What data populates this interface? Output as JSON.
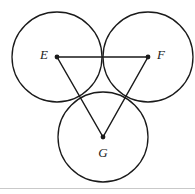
{
  "figure": {
    "background_color": "#ffffff",
    "stroke_color": "#1a1a1a",
    "rule_color": "#c9c9c9",
    "canvas": {
      "width": 195,
      "height": 194
    },
    "circles": [
      {
        "id": "circle-e",
        "cx": 57,
        "cy": 57,
        "r": 45
      },
      {
        "id": "circle-f",
        "cx": 148,
        "cy": 57,
        "r": 45
      },
      {
        "id": "circle-g",
        "cx": 103,
        "cy": 137,
        "r": 45
      }
    ],
    "triangle": {
      "id": "triangle-efg",
      "points": "57,57 148,57 103,137",
      "edges": [
        {
          "id": "edge-ef",
          "x1": 57,
          "y1": 57,
          "x2": 148,
          "y2": 57
        },
        {
          "id": "edge-fg",
          "x1": 148,
          "y1": 57,
          "x2": 103,
          "y2": 137
        },
        {
          "id": "edge-ge",
          "x1": 103,
          "y1": 137,
          "x2": 57,
          "y2": 57
        }
      ]
    },
    "vertices": [
      {
        "id": "vertex-e",
        "label": "E",
        "cx": 57,
        "cy": 57,
        "label_x": 44,
        "label_y": 56,
        "anchor": "middle"
      },
      {
        "id": "vertex-f",
        "label": "F",
        "cx": 148,
        "cy": 57,
        "label_x": 161,
        "label_y": 56,
        "anchor": "middle"
      },
      {
        "id": "vertex-g",
        "label": "G",
        "cx": 103,
        "cy": 137,
        "label_x": 103,
        "label_y": 154,
        "anchor": "middle"
      }
    ],
    "dot_radius": 2.4,
    "bottom_rule": {
      "x1": 0,
      "y1": 188.5,
      "x2": 195,
      "y2": 188.5
    }
  }
}
